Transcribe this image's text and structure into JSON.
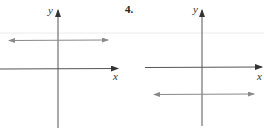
{
  "problem_number": "4.",
  "graphs": [
    {
      "id": "left",
      "x_label": "x",
      "y_label": "y",
      "horizontal_line_position": "above x-axis"
    },
    {
      "id": "right",
      "x_label": "x",
      "y_label": "y",
      "horizontal_line_position": "below x-axis"
    }
  ],
  "colors": {
    "axis": "#444444",
    "line": "#8a8a8a",
    "faint_rule": "#e6e6e6"
  }
}
